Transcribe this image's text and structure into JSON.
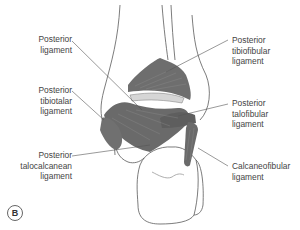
{
  "figure": {
    "panel_label": "B",
    "labels": {
      "posterior_ligament": [
        "Posterior",
        "ligament"
      ],
      "posterior_tibiotalar": [
        "Posterior",
        "tibiotalar",
        "ligament"
      ],
      "posterior_talocalcanean": [
        "Posterior",
        "talocalcanean",
        "ligament"
      ],
      "posterior_tibiofibular": [
        "Posterior",
        "tibiofibular",
        "ligament"
      ],
      "posterior_talofibular": [
        "Posterior",
        "talofibular",
        "ligament"
      ],
      "calcaneofibular": [
        "Calcaneofibular",
        "ligament"
      ]
    },
    "colors": {
      "ligament_fill": "#6e6e6e",
      "ligament_dark": "#555555",
      "bone_outline": "#5a5a5a",
      "leader_line": "#555555",
      "text": "#444444"
    }
  }
}
